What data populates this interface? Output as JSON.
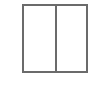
{
  "icon": {
    "semantic": "split-columns-icon",
    "panes": 2,
    "stroke_color": "#6b6b6b",
    "fill_color": "#ffffff"
  }
}
